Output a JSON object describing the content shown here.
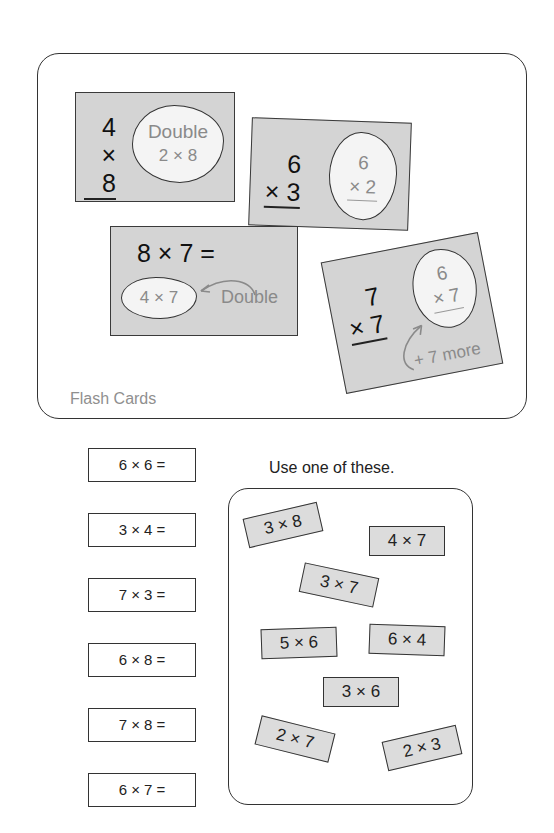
{
  "flash_cards": {
    "title": "Flash Cards",
    "cards": [
      {
        "top": "4",
        "bottom": "× 8",
        "hint_line1": "Double",
        "hint_line2": "2 × 8"
      },
      {
        "top": "6",
        "bottom": "× 3",
        "hint_top": "6",
        "hint_bottom": "× 2"
      },
      {
        "equation": "8 × 7 =",
        "hint": "4 × 7",
        "annotation": "Double"
      },
      {
        "top": "7",
        "bottom": "× 7",
        "hint_top": "6",
        "hint_bottom": "× 7",
        "annotation": "+ 7 more"
      }
    ]
  },
  "practice": {
    "facts": [
      "6 × 6 =",
      "3 × 4 =",
      "7 × 3 =",
      "6 × 8 =",
      "7 × 8 =",
      "6 × 7 ="
    ],
    "instruction": "Use one of these.",
    "choices": [
      "3 × 8",
      "4 × 7",
      "3 × 7",
      "5 × 6",
      "6 × 4",
      "3 × 6",
      "2 × 7",
      "2 × 3"
    ]
  },
  "colors": {
    "card_fill": "#d4d4d4",
    "cloud_fill": "#f4f4f4",
    "hint_text": "#8a8a8a",
    "border": "#333333"
  }
}
